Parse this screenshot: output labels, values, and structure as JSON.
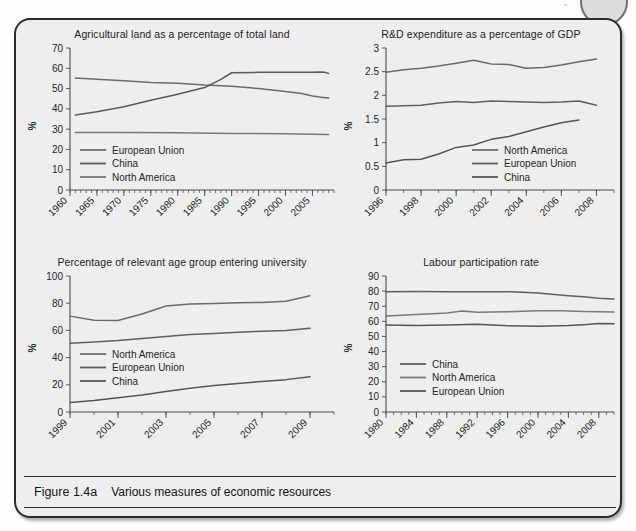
{
  "figure": {
    "label": "Figure 1.4a",
    "caption": "Various measures of economic resources",
    "panel_bg": "#eeeeee",
    "border_color": "#2b2b2b"
  },
  "page_decor": {
    "corner_circle_name": "page-corner-circle",
    "corner_mark": "''"
  },
  "chart_data": [
    {
      "id": "agricultural-land",
      "type": "line",
      "title": "Agricultural land as a percentage of total land",
      "xlabel": "",
      "ylabel": "%",
      "xlim": [
        1960,
        2009
      ],
      "ylim": [
        0,
        70
      ],
      "ytick_values": [
        0,
        10,
        20,
        30,
        40,
        50,
        60,
        70
      ],
      "ytick_labels": [
        "0",
        "10",
        "20",
        "30",
        "40",
        "50",
        "60",
        "70"
      ],
      "xtick_values": [
        1960,
        1965,
        1970,
        1975,
        1980,
        1985,
        1990,
        1995,
        2000,
        2005
      ],
      "xtick_labels": [
        "1960",
        "1965",
        "1970",
        "1975",
        "1980",
        "1985",
        "1990",
        "1995",
        "2000",
        "2005"
      ],
      "minor_tick_step": 1,
      "grid": false,
      "legend_position": "inside-lower-left",
      "series": [
        {
          "name": "European Union",
          "color": "#6b6b6b",
          "x": [
            1961,
            1965,
            1970,
            1975,
            1980,
            1985,
            1990,
            1995,
            2000,
            2003,
            2005,
            2007,
            2008
          ],
          "values": [
            55.2,
            54.6,
            53.8,
            53.0,
            52.6,
            51.7,
            51.2,
            50.0,
            48.6,
            47.6,
            46.3,
            45.6,
            45.3
          ]
        },
        {
          "name": "China",
          "color": "#5a5a5a",
          "x": [
            1961,
            1965,
            1970,
            1975,
            1980,
            1985,
            1988,
            1990,
            1995,
            2000,
            2005,
            2007,
            2008
          ],
          "values": [
            37.0,
            38.6,
            41.0,
            44.2,
            47.2,
            50.5,
            54.5,
            57.8,
            58.0,
            58.0,
            58.0,
            58.2,
            57.5
          ]
        },
        {
          "name": "North America",
          "color": "#787878",
          "x": [
            1961,
            1970,
            1980,
            1990,
            2000,
            2005,
            2008
          ],
          "values": [
            28.4,
            28.3,
            28.2,
            27.9,
            27.7,
            27.5,
            27.4
          ]
        }
      ]
    },
    {
      "id": "rd-expenditure",
      "type": "line",
      "title": "R&D expenditure as a percentage of GDP",
      "xlabel": "",
      "ylabel": "%",
      "xlim": [
        1996,
        2009
      ],
      "ylim": [
        0,
        3
      ],
      "ytick_values": [
        0,
        0.5,
        1,
        1.5,
        2,
        2.5,
        3
      ],
      "ytick_labels": [
        "0",
        "0.5",
        "1",
        "1.5",
        "2",
        "2.5",
        "3"
      ],
      "xtick_values": [
        1996,
        1998,
        2000,
        2002,
        2004,
        2006,
        2008
      ],
      "xtick_labels": [
        "1996",
        "1998",
        "2000",
        "2002",
        "2004",
        "2006",
        "2008"
      ],
      "minor_tick_step": 1,
      "grid": false,
      "legend_position": "inside-lower-right",
      "series": [
        {
          "name": "North America",
          "color": "#6b6b6b",
          "x": [
            1996,
            1997,
            1998,
            1999,
            2000,
            2001,
            2002,
            2003,
            2004,
            2005,
            2006,
            2007,
            2008
          ],
          "values": [
            2.49,
            2.54,
            2.57,
            2.62,
            2.68,
            2.74,
            2.66,
            2.65,
            2.57,
            2.59,
            2.64,
            2.71,
            2.77
          ]
        },
        {
          "name": "European Union",
          "color": "#5f5f5f",
          "x": [
            1996,
            1997,
            1998,
            1999,
            2000,
            2001,
            2002,
            2003,
            2004,
            2005,
            2006,
            2007,
            2008
          ],
          "values": [
            1.77,
            1.78,
            1.79,
            1.84,
            1.87,
            1.85,
            1.88,
            1.87,
            1.86,
            1.85,
            1.86,
            1.88,
            1.79
          ]
        },
        {
          "name": "China",
          "color": "#555555",
          "x": [
            1996,
            1997,
            1998,
            1999,
            2000,
            2001,
            2002,
            2003,
            2004,
            2005,
            2006,
            2007
          ],
          "values": [
            0.57,
            0.64,
            0.65,
            0.76,
            0.9,
            0.95,
            1.07,
            1.13,
            1.23,
            1.33,
            1.42,
            1.48
          ]
        }
      ]
    },
    {
      "id": "university-entry",
      "type": "line",
      "title": "Percentage of relevant age group entering university",
      "xlabel": "",
      "ylabel": "%",
      "xlim": [
        1999,
        2010
      ],
      "ylim": [
        0,
        100
      ],
      "ytick_values": [
        0,
        20,
        40,
        60,
        80,
        100
      ],
      "ytick_labels": [
        "0",
        "20",
        "40",
        "60",
        "80",
        "100"
      ],
      "xtick_values": [
        1999,
        2001,
        2003,
        2005,
        2007,
        2009
      ],
      "xtick_labels": [
        "1999",
        "2001",
        "2003",
        "2005",
        "2007",
        "2009"
      ],
      "minor_tick_step": 1,
      "grid": false,
      "legend_position": "inside-middle-left",
      "series": [
        {
          "name": "North America",
          "color": "#6b6b6b",
          "x": [
            1999,
            2000,
            2001,
            2002,
            2003,
            2004,
            2005,
            2006,
            2007,
            2008,
            2009
          ],
          "values": [
            70.5,
            67.5,
            67.3,
            72.0,
            78.0,
            79.5,
            79.8,
            80.3,
            80.5,
            81.5,
            85.5
          ]
        },
        {
          "name": "European Union",
          "color": "#5f5f5f",
          "x": [
            1999,
            2000,
            2001,
            2002,
            2003,
            2004,
            2005,
            2006,
            2007,
            2008,
            2009
          ],
          "values": [
            50.5,
            51.5,
            52.5,
            54.0,
            55.5,
            57.0,
            57.8,
            58.7,
            59.3,
            60.0,
            61.5
          ]
        },
        {
          "name": "China",
          "color": "#555555",
          "x": [
            1999,
            2000,
            2001,
            2002,
            2003,
            2004,
            2005,
            2006,
            2007,
            2008,
            2009
          ],
          "values": [
            7.0,
            8.5,
            10.5,
            12.5,
            15.0,
            17.5,
            19.5,
            21.0,
            22.5,
            23.8,
            26.0
          ]
        }
      ]
    },
    {
      "id": "labour-participation",
      "type": "line",
      "title": "Labour participation rate",
      "xlabel": "",
      "ylabel": "%",
      "xlim": [
        1980,
        2010
      ],
      "ylim": [
        0,
        90
      ],
      "ytick_values": [
        0,
        10,
        20,
        30,
        40,
        50,
        60,
        70,
        80,
        90
      ],
      "ytick_labels": [
        "0",
        "10",
        "20",
        "30",
        "40",
        "50",
        "60",
        "70",
        "80",
        "90"
      ],
      "xtick_values": [
        1980,
        1984,
        1988,
        1992,
        1996,
        2000,
        2004,
        2008
      ],
      "xtick_labels": [
        "1980",
        "1984",
        "1988",
        "1992",
        "1996",
        "2000",
        "2004",
        "2008"
      ],
      "minor_tick_step": 1,
      "grid": false,
      "legend_position": "inside-lower-left",
      "series": [
        {
          "name": "China",
          "color": "#5f5f5f",
          "x": [
            1980,
            1984,
            1988,
            1992,
            1996,
            1998,
            2000,
            2004,
            2006,
            2008,
            2010
          ],
          "values": [
            79.5,
            79.7,
            79.6,
            79.5,
            79.6,
            79.3,
            78.8,
            77.0,
            76.2,
            75.3,
            74.8
          ]
        },
        {
          "name": "North America",
          "color": "#7a7a7a",
          "x": [
            1980,
            1984,
            1988,
            1990,
            1992,
            1996,
            2000,
            2003,
            2006,
            2008,
            2010
          ],
          "values": [
            63.5,
            64.5,
            65.5,
            66.8,
            66.0,
            66.3,
            67.0,
            67.0,
            66.5,
            66.3,
            66.2
          ]
        },
        {
          "name": "European Union",
          "color": "#545454",
          "x": [
            1980,
            1984,
            1988,
            1992,
            1996,
            2000,
            2004,
            2006,
            2008,
            2010
          ],
          "values": [
            57.5,
            57.2,
            57.5,
            58.0,
            57.0,
            56.8,
            57.3,
            57.8,
            58.5,
            58.4
          ]
        }
      ]
    }
  ]
}
